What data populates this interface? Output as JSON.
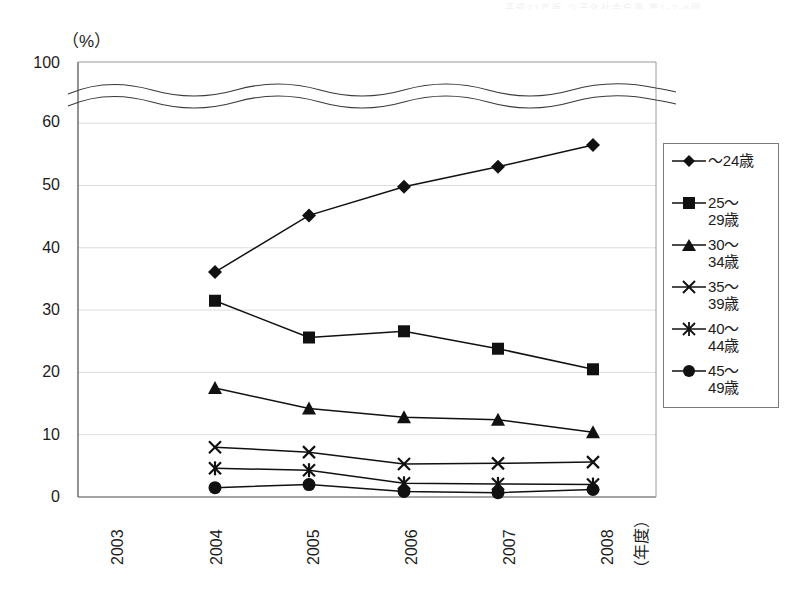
{
  "chart_data": {
    "type": "line",
    "title": "",
    "xlabel": "（年度）",
    "ylabel": "（%）",
    "ylim": [
      0,
      100
    ],
    "y_ticks": [
      0,
      10,
      20,
      30,
      40,
      50,
      60,
      100
    ],
    "y_axis_broken": true,
    "y_break_between": [
      60,
      100
    ],
    "grid": true,
    "legend_position": "right",
    "categories": [
      "2003",
      "2004",
      "2005",
      "2006",
      "2007",
      "2008"
    ],
    "series": [
      {
        "name": "～24歳",
        "marker": "diamond",
        "values": [
          null,
          36.1,
          45.2,
          49.8,
          53.0,
          56.5
        ]
      },
      {
        "name": "25～\n29歳",
        "marker": "square",
        "values": [
          null,
          31.5,
          25.6,
          26.6,
          23.8,
          20.5
        ]
      },
      {
        "name": "30～\n34歳",
        "marker": "triangle",
        "values": [
          null,
          17.5,
          14.2,
          12.8,
          12.4,
          10.4
        ]
      },
      {
        "name": "35～\n39歳",
        "marker": "cross",
        "values": [
          null,
          8.0,
          7.2,
          5.3,
          5.4,
          5.6
        ]
      },
      {
        "name": "40～\n44歳",
        "marker": "asterisk",
        "values": [
          null,
          4.6,
          4.3,
          2.2,
          2.1,
          2.0
        ]
      },
      {
        "name": "45～\n49歳",
        "marker": "circle",
        "values": [
          null,
          1.5,
          2.0,
          0.9,
          0.7,
          1.2
        ]
      }
    ]
  },
  "axis": {
    "unit_label": "（%）",
    "x_title": "（年度）",
    "y_tick_labels": [
      "100",
      "60",
      "50",
      "40",
      "30",
      "20",
      "10",
      "0"
    ],
    "x_tick_labels": [
      "2003",
      "2004",
      "2005",
      "2006",
      "2007",
      "2008"
    ]
  },
  "legend": {
    "items": [
      {
        "label": "～24歳",
        "marker": "diamond"
      },
      {
        "label": "25～\n29歳",
        "marker": "square"
      },
      {
        "label": "30～\n34歳",
        "marker": "triangle"
      },
      {
        "label": "35～\n39歳",
        "marker": "cross"
      },
      {
        "label": "40～\n44歳",
        "marker": "asterisk"
      },
      {
        "label": "45～\n49歳",
        "marker": "circle"
      }
    ]
  },
  "colors": {
    "line": "#111111",
    "marker": "#111111",
    "grid": "#dcdcdc",
    "axis": "#4a4a4a",
    "text": "#1c1c1c"
  },
  "artifact": {
    "top_text": "平成21年版  少子化社会白書  第1-2-8図"
  }
}
